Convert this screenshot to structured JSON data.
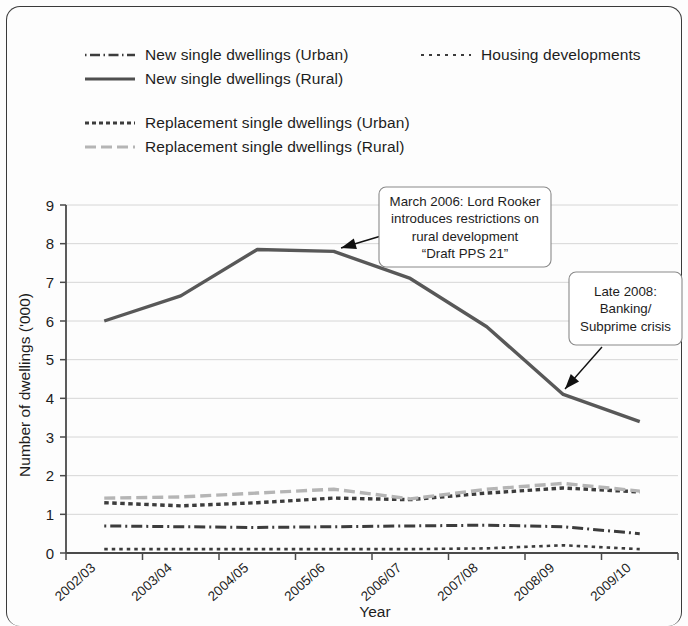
{
  "chart_data": {
    "type": "line",
    "title": "",
    "xlabel": "Year",
    "ylabel": "Number of dwellings ('000)",
    "categories": [
      "2002/03",
      "2003/04",
      "2004/05",
      "2005/06",
      "2006/07",
      "2007/08",
      "2008/09",
      "2009/10"
    ],
    "ylim": [
      0,
      9
    ],
    "ytick_values": [
      "0",
      "1",
      "2",
      "3",
      "4",
      "5",
      "6",
      "7",
      "8",
      "9"
    ],
    "grid": true,
    "legend_position": "top",
    "series": [
      {
        "name": "New single dwellings (Urban)",
        "style": "dash-dot",
        "color": "#3c3c3c",
        "values": [
          0.7,
          0.68,
          0.66,
          0.68,
          0.7,
          0.72,
          0.68,
          0.5
        ]
      },
      {
        "name": "New single dwellings (Rural)",
        "style": "solid",
        "color": "#585858",
        "values": [
          6.0,
          6.65,
          7.85,
          7.8,
          7.1,
          5.85,
          4.1,
          3.4
        ]
      },
      {
        "name": "Housing developments",
        "style": "dotted",
        "color": "#3c3c3c",
        "values": [
          0.1,
          0.1,
          0.1,
          0.1,
          0.1,
          0.12,
          0.2,
          0.1
        ]
      },
      {
        "name": "Replacement single dwellings (Urban)",
        "style": "dotted-thick",
        "color": "#3c3c3c",
        "values": [
          1.3,
          1.22,
          1.3,
          1.42,
          1.38,
          1.55,
          1.68,
          1.58
        ]
      },
      {
        "name": "Replacement single dwellings (Rural)",
        "style": "dashed",
        "color": "#b5b5b5",
        "values": [
          1.42,
          1.45,
          1.55,
          1.65,
          1.4,
          1.65,
          1.8,
          1.6
        ]
      }
    ],
    "annotations": [
      {
        "id": "annot-rooker",
        "lines": [
          "March 2006: Lord Rooker",
          "introduces restrictions on",
          "rural development",
          "“Draft PPS 21”"
        ],
        "points_to_category": "2005/06",
        "points_to_value": 7.8
      },
      {
        "id": "annot-banking",
        "lines": [
          "Late 2008:",
          "Banking/",
          "Subprime crisis"
        ],
        "points_to_category": "2008/09",
        "points_to_value": 4.1
      }
    ]
  },
  "legend": {
    "items": [
      {
        "key": "new-urban",
        "label": "New single dwellings (Urban)"
      },
      {
        "key": "new-rural",
        "label": "New single dwellings (Rural)"
      },
      {
        "key": "housing",
        "label": "Housing developments"
      },
      {
        "key": "rep-urban",
        "label": "Replacement single dwellings (Urban)"
      },
      {
        "key": "rep-rural",
        "label": "Replacement single dwellings (Rural)"
      }
    ]
  },
  "axes": {
    "y_title": "Number of dwellings ('000)",
    "x_title": "Year",
    "y_ticks": [
      "9",
      "8",
      "7",
      "6",
      "5",
      "4",
      "3",
      "2",
      "1",
      "0"
    ],
    "x_ticks": [
      "2002/03",
      "2003/04",
      "2004/05",
      "2005/06",
      "2006/07",
      "2007/08",
      "2008/09",
      "2009/10"
    ]
  },
  "annotations": {
    "rooker": {
      "line1": "March 2006: Lord Rooker",
      "line2": "introduces restrictions on",
      "line3": "rural development",
      "line4": "“Draft PPS 21”"
    },
    "banking": {
      "line1": "Late 2008:",
      "line2": "Banking/",
      "line3": "Subprime crisis"
    }
  },
  "colors": {
    "rural_line": "#585858",
    "rep_rural_line": "#b5b5b5",
    "dark_line": "#3c3c3c",
    "grid": "#d6d6d6",
    "axis": "#4a4a4a",
    "frame": "#3a3a3a"
  }
}
